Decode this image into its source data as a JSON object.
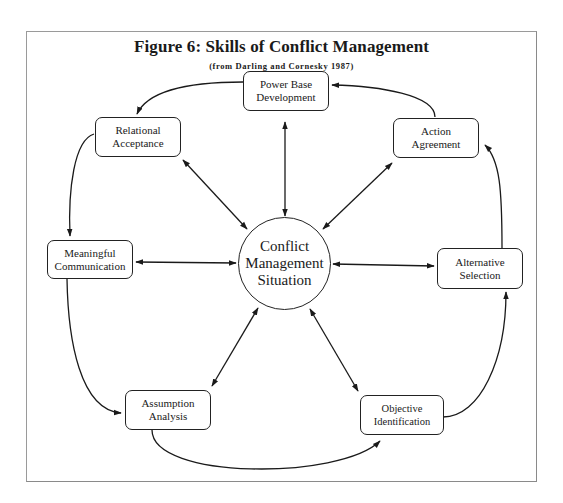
{
  "figure": {
    "title": "Figure 6: Skills of Conflict Management",
    "subtitle": "(from Darling and Cornesky 1987)"
  },
  "center": {
    "line1": "Conflict",
    "line2": "Management",
    "line3": "Situation"
  },
  "nodes": {
    "power_base": {
      "line1": "Power Base",
      "line2": "Development"
    },
    "relational": {
      "line1": "Relational",
      "line2": "Acceptance"
    },
    "action": {
      "line1": "Action",
      "line2": "Agreement"
    },
    "meaningful": {
      "line1": "Meaningful",
      "line2": "Communication"
    },
    "alternative": {
      "line1": "Alternative",
      "line2": "Selection"
    },
    "assumption": {
      "line1": "Assumption",
      "line2": "Analysis"
    },
    "objective": {
      "line1": "Objective",
      "line2": "Identification"
    }
  },
  "cycle_order": [
    "Power Base Development",
    "Relational Acceptance",
    "Meaningful Communication",
    "Assumption Analysis",
    "Objective Identification",
    "Alternative Selection",
    "Action Agreement"
  ],
  "colors": {
    "line": "#1a1a1a",
    "frame": "#9a9a9a",
    "background": "#ffffff"
  }
}
